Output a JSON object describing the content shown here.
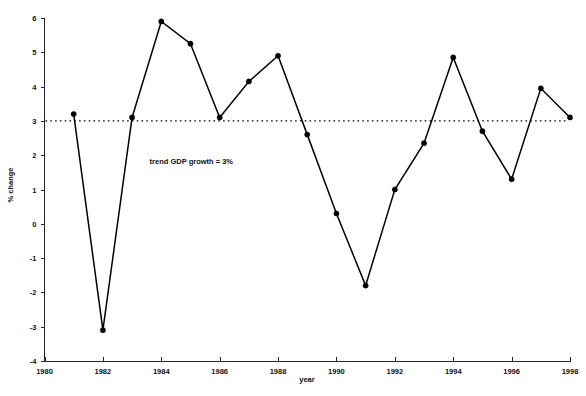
{
  "chart_data": {
    "type": "line",
    "title": "",
    "xlabel": "year",
    "ylabel": "% change",
    "xlim": [
      1980,
      1998
    ],
    "ylim": [
      -4,
      6
    ],
    "grid": false,
    "legend": "none",
    "x": [
      1981,
      1982,
      1983,
      1984,
      1985,
      1986,
      1987,
      1988,
      1989,
      1990,
      1991,
      1992,
      1993,
      1994,
      1995,
      1996,
      1997,
      1998
    ],
    "values": [
      3.2,
      -3.1,
      3.1,
      5.9,
      5.25,
      3.1,
      4.15,
      4.9,
      2.6,
      0.3,
      -1.8,
      1.0,
      2.35,
      4.85,
      2.7,
      1.3,
      3.95,
      3.1
    ],
    "series": [
      {
        "name": "GDP % change",
        "values": [
          3.2,
          -3.1,
          3.1,
          5.9,
          5.25,
          3.1,
          4.15,
          4.9,
          2.6,
          0.3,
          -1.8,
          1.0,
          2.35,
          4.85,
          2.7,
          1.3,
          3.95,
          3.1
        ]
      }
    ],
    "xticks": [
      1980,
      1982,
      1984,
      1986,
      1988,
      1990,
      1992,
      1994,
      1996,
      1998
    ],
    "xticklabels": [
      "1980",
      "1982",
      "1984",
      "1986",
      "1988",
      "1990",
      "1992",
      "1994",
      "1996",
      "1998"
    ],
    "yticks": [
      -4,
      -3,
      -2,
      -1,
      0,
      1,
      2,
      3,
      4,
      5,
      6
    ],
    "yticklabels": [
      "-4",
      "-3",
      "-2",
      "-1",
      "0",
      "1",
      "2",
      "3",
      "4",
      "5",
      "6"
    ],
    "reference_lines": [
      {
        "name": "trend-gdp-growth",
        "orientation": "horizontal",
        "value": 3,
        "style": "dotted",
        "label": "trend GDP growth = 3%"
      }
    ],
    "annotations": [
      {
        "text": "trend GDP growth = 3%",
        "x": 1983.6,
        "y": 1.75
      }
    ],
    "colors": {
      "line": "#000000",
      "marker": "#000000",
      "axis": "#262626",
      "text": "#111111",
      "background": "#ffffff"
    }
  }
}
